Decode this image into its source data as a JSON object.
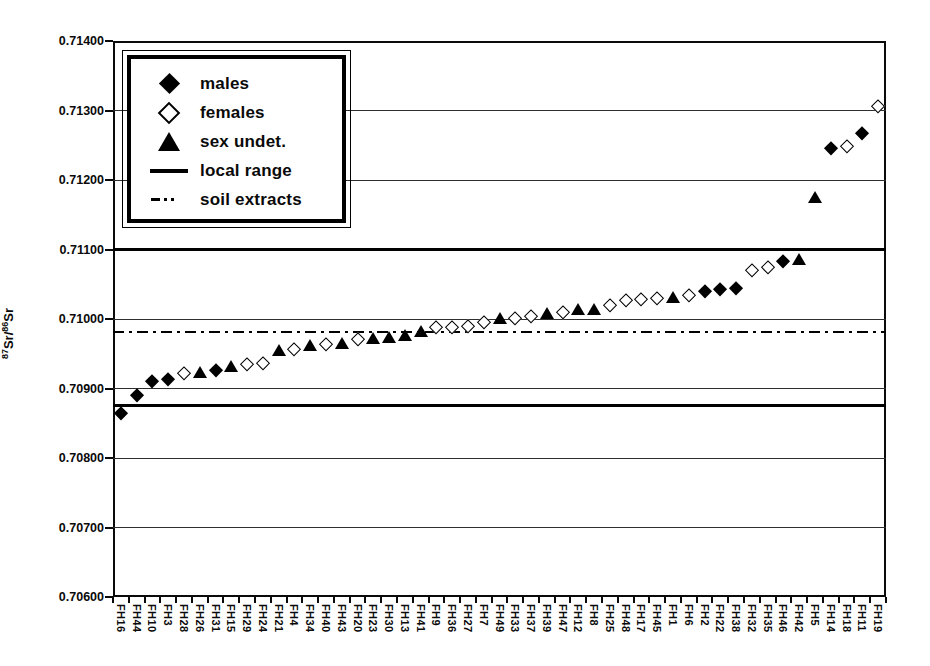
{
  "chart_data": {
    "type": "scatter",
    "title": "",
    "ylabel_parts": {
      "sup1": "87",
      "text1": "Sr/",
      "sup2": "86",
      "text2": "Sr"
    },
    "y_axis": {
      "min": 0.706,
      "max": 0.714,
      "step": 0.001,
      "tick_labels": [
        "0.71400",
        "0.71300",
        "0.71200",
        "0.71100",
        "0.71000",
        "0.70900",
        "0.70800",
        "0.70700",
        "0.70600"
      ]
    },
    "grid": "horizontal",
    "legend": {
      "position": "top-left",
      "items": [
        {
          "label": "males",
          "marker": "filled-diamond"
        },
        {
          "label": "females",
          "marker": "open-diamond"
        },
        {
          "label": "sex undet.",
          "marker": "filled-triangle"
        },
        {
          "label": "local range",
          "marker": "solid-line"
        },
        {
          "label": "soil extracts",
          "marker": "dash-dot-line"
        }
      ]
    },
    "reference_lines": {
      "local_range": {
        "label": "local range",
        "style": "solid-thick",
        "values": [
          0.711,
          0.70876
        ]
      },
      "soil_extracts": {
        "label": "soil extracts",
        "style": "dash-dot",
        "value": 0.70982
      }
    },
    "categories": [
      "FH16",
      "FH44",
      "FH10",
      "FH3",
      "FH28",
      "FH26",
      "FH31",
      "FH15",
      "FH29",
      "FH24",
      "FH21",
      "FH4",
      "FH34",
      "FH40",
      "FH43",
      "FH20",
      "FH23",
      "FH30",
      "FH13",
      "FH41",
      "FH9",
      "FH36",
      "FH27",
      "FH7",
      "FH49",
      "FH33",
      "FH37",
      "FH39",
      "FH47",
      "FH12",
      "FH8",
      "FH25",
      "FH48",
      "FH17",
      "FH45",
      "FH1",
      "FH6",
      "FH2",
      "FH22",
      "FH38",
      "FH32",
      "FH35",
      "FH46",
      "FH42",
      "FH5",
      "FH14",
      "FH18",
      "FH11",
      "FH19"
    ],
    "points": [
      {
        "label": "FH16",
        "group": "male",
        "value": 0.70865
      },
      {
        "label": "FH44",
        "group": "male",
        "value": 0.70891
      },
      {
        "label": "FH10",
        "group": "male",
        "value": 0.70911
      },
      {
        "label": "FH3",
        "group": "male",
        "value": 0.70914
      },
      {
        "label": "FH28",
        "group": "female",
        "value": 0.70922
      },
      {
        "label": "FH26",
        "group": "undet",
        "value": 0.70924
      },
      {
        "label": "FH31",
        "group": "male",
        "value": 0.70926
      },
      {
        "label": "FH15",
        "group": "undet",
        "value": 0.70932
      },
      {
        "label": "FH29",
        "group": "female",
        "value": 0.70935
      },
      {
        "label": "FH24",
        "group": "female",
        "value": 0.70937
      },
      {
        "label": "FH21",
        "group": "undet",
        "value": 0.70955
      },
      {
        "label": "FH4",
        "group": "female",
        "value": 0.70957
      },
      {
        "label": "FH34",
        "group": "undet",
        "value": 0.70962
      },
      {
        "label": "FH40",
        "group": "female",
        "value": 0.70964
      },
      {
        "label": "FH43",
        "group": "undet",
        "value": 0.70966
      },
      {
        "label": "FH20",
        "group": "female",
        "value": 0.70971
      },
      {
        "label": "FH23",
        "group": "undet",
        "value": 0.70972
      },
      {
        "label": "FH30",
        "group": "undet",
        "value": 0.70974
      },
      {
        "label": "FH13",
        "group": "undet",
        "value": 0.70977
      },
      {
        "label": "FH41",
        "group": "undet",
        "value": 0.70983
      },
      {
        "label": "FH9",
        "group": "female",
        "value": 0.70988
      },
      {
        "label": "FH36",
        "group": "female",
        "value": 0.70989
      },
      {
        "label": "FH27",
        "group": "female",
        "value": 0.7099
      },
      {
        "label": "FH7",
        "group": "female",
        "value": 0.70996
      },
      {
        "label": "FH49",
        "group": "undet",
        "value": 0.71001
      },
      {
        "label": "FH33",
        "group": "female",
        "value": 0.71002
      },
      {
        "label": "FH37",
        "group": "female",
        "value": 0.71004
      },
      {
        "label": "FH39",
        "group": "undet",
        "value": 0.71009
      },
      {
        "label": "FH47",
        "group": "female",
        "value": 0.7101
      },
      {
        "label": "FH12",
        "group": "undet",
        "value": 0.71014
      },
      {
        "label": "FH8",
        "group": "undet",
        "value": 0.71015
      },
      {
        "label": "FH25",
        "group": "female",
        "value": 0.7102
      },
      {
        "label": "FH48",
        "group": "female",
        "value": 0.71027
      },
      {
        "label": "FH17",
        "group": "female",
        "value": 0.71029
      },
      {
        "label": "FH45",
        "group": "female",
        "value": 0.7103
      },
      {
        "label": "FH1",
        "group": "undet",
        "value": 0.71032
      },
      {
        "label": "FH6",
        "group": "female",
        "value": 0.71035
      },
      {
        "label": "FH2",
        "group": "male",
        "value": 0.7104
      },
      {
        "label": "FH22",
        "group": "male",
        "value": 0.71043
      },
      {
        "label": "FH38",
        "group": "male",
        "value": 0.71045
      },
      {
        "label": "FH32",
        "group": "female",
        "value": 0.7107
      },
      {
        "label": "FH35",
        "group": "female",
        "value": 0.71075
      },
      {
        "label": "FH46",
        "group": "male",
        "value": 0.71083
      },
      {
        "label": "FH42",
        "group": "undet",
        "value": 0.71086
      },
      {
        "label": "FH5",
        "group": "undet",
        "value": 0.71176
      },
      {
        "label": "FH14",
        "group": "male",
        "value": 0.71246
      },
      {
        "label": "FH18",
        "group": "female",
        "value": 0.71249
      },
      {
        "label": "FH11",
        "group": "male",
        "value": 0.71268
      },
      {
        "label": "FH19",
        "group": "female",
        "value": 0.71306
      }
    ]
  }
}
